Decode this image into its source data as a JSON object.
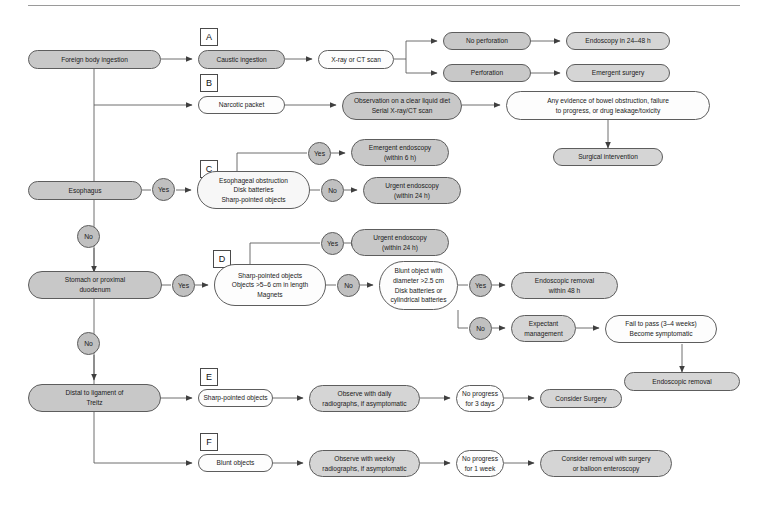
{
  "diagram": {
    "style": {
      "line_color": "#5d5d5d",
      "fill_dark": "#c8c8c8",
      "fill_mid": "#d5d5d5",
      "fill_light": "#f7f7f7",
      "fill_white": "#fdfdfd",
      "text_color": "#1a1a1a"
    },
    "tags": [
      {
        "id": "tag-a",
        "label": "A"
      },
      {
        "id": "tag-b",
        "label": "B"
      },
      {
        "id": "tag-c",
        "label": "C"
      },
      {
        "id": "tag-d",
        "label": "D"
      },
      {
        "id": "tag-e",
        "label": "E"
      },
      {
        "id": "tag-f",
        "label": "F"
      }
    ],
    "decisions": [
      {
        "id": "esophagus-yes",
        "label": "Yes"
      },
      {
        "id": "esophagus-no",
        "label": "No"
      },
      {
        "id": "c-yes",
        "label": "Yes"
      },
      {
        "id": "c-no",
        "label": "No"
      },
      {
        "id": "stomach-yes",
        "label": "Yes"
      },
      {
        "id": "stomach-no",
        "label": "No"
      },
      {
        "id": "d-yes",
        "label": "Yes"
      },
      {
        "id": "d-no",
        "label": "No"
      },
      {
        "id": "blunt-yes",
        "label": "Yes"
      },
      {
        "id": "blunt-no",
        "label": "No"
      }
    ],
    "nodes": {
      "foreign_body": "Foreign body ingestion",
      "caustic": "Caustic ingestion",
      "xray_ct": "X-ray or CT scan",
      "no_perforation": "No perforation",
      "perforation": "Perforation",
      "endoscopy_24_48": "Endoscopy in 24–48 h",
      "emergent_surgery": "Emergent surgery",
      "narcotic_packet": "Narcotic packet",
      "observation_clear_liquid": "Observation on a clear liquid diet\nSerial X-ray/CT scan",
      "bowel_obstruction": "Any evidence of bowel obstruction, failure\nto progress, or drug leakage/toxicity",
      "surgical_intervention": "Surgical intervention",
      "esophagus": "Esophagus",
      "esophageal_criteria": "Esophageal obstruction\nDisk batteries\nSharp-pointed objects",
      "emergent_endoscopy_6h": "Emergent endoscopy\n(within 6 h)",
      "urgent_endoscopy_24h_c": "Urgent endoscopy\n(within 24 h)",
      "stomach_duodenum": "Stomach or proximal\nduodenum",
      "stomach_criteria": "Sharp-pointed objects\nObjects >5–6 cm in length\nMagnets",
      "urgent_endoscopy_24h_d": "Urgent endoscopy\n(within 24 h)",
      "blunt_criteria": "Blunt object with\ndiameter >2.5 cm\nDisk batteries or\ncylindrical batteries",
      "endoscopic_removal_48h": "Endoscopic removal\nwithin 48 h",
      "expectant_management": "Expectant\nmanagement",
      "fail_to_pass": "Fail to pass (3–4 weeks)\nBecome symptomatic",
      "endoscopic_removal": "Endoscopic removal",
      "distal_treitz": "Distal to ligament of\nTreitz",
      "sharp_pointed_objects_e": "Sharp-pointed objects",
      "observe_daily": "Observe with daily\nradiographs, if asymptomatic",
      "no_progress_3_days": "No progress\nfor 3 days",
      "consider_surgery": "Consider Surgery",
      "blunt_objects_f": "Blunt objects",
      "observe_weekly": "Observe with weekly\nradiographs, if asymptomatic",
      "no_progress_1_week": "No progress\nfor 1 week",
      "consider_removal_balloon": "Consider removal with surgery\nor balloon enteroscopy"
    }
  }
}
